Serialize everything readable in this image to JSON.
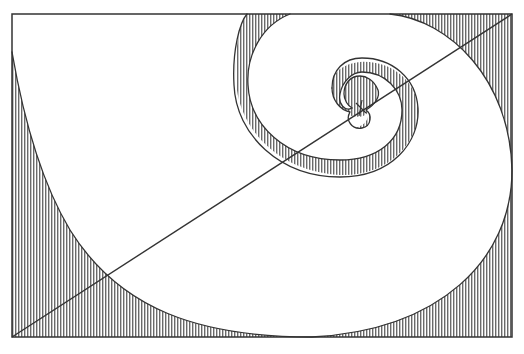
{
  "diagram": {
    "title": "Logarithmic spiral inscribed in golden rectangle",
    "type": "golden-spiral",
    "frame": {
      "x": 12,
      "y": 14,
      "width": 500,
      "height": 323
    },
    "diagonal": {
      "from": [
        12,
        337
      ],
      "to": [
        512,
        14
      ]
    },
    "center_marker": {
      "x": 360,
      "y": 108,
      "shape": "cross"
    },
    "colors": {
      "stroke": "#333333",
      "hatch": "#555555",
      "background": "#ffffff",
      "hatch_fill": "#c8c8c8"
    },
    "fill_pattern": "vertical-hatch",
    "regions": [
      {
        "name": "outer-corner-top-left",
        "fill": "hatched"
      },
      {
        "name": "outer-corner-bottom-left",
        "fill": "hatched"
      },
      {
        "name": "outer-corner-bottom-right",
        "fill": "hatched"
      },
      {
        "name": "outer-corner-top-right",
        "fill": "hatched"
      },
      {
        "name": "spiral-band-1",
        "fill": "white"
      },
      {
        "name": "spiral-band-2",
        "fill": "hatched"
      },
      {
        "name": "spiral-band-3",
        "fill": "white"
      },
      {
        "name": "spiral-band-4",
        "fill": "hatched"
      }
    ]
  }
}
